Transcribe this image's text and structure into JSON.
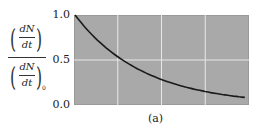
{
  "chart_data": {
    "type": "line",
    "title": "",
    "caption": "(a)",
    "xlabel": "",
    "ylabel": "(dN/dt) / (dN/dt)_0",
    "ylim": [
      0.0,
      1.0
    ],
    "yticks": [
      "0.0",
      "0.5",
      "1.0"
    ],
    "xticks": [],
    "grid": true,
    "background": "#a9a9a9",
    "line_color": "#1a1a1a",
    "x": [
      0,
      0.125,
      0.25,
      0.375,
      0.5,
      0.625,
      0.75,
      0.875,
      1.0
    ],
    "series": [
      {
        "name": "decay",
        "values": [
          1.0,
          0.73,
          0.54,
          0.39,
          0.29,
          0.21,
          0.15,
          0.11,
          0.08
        ]
      }
    ]
  },
  "labels": {
    "num_top": "dN",
    "den_top": "dt",
    "num_bot": "dN",
    "den_bot": "dt",
    "subscript": "0"
  }
}
